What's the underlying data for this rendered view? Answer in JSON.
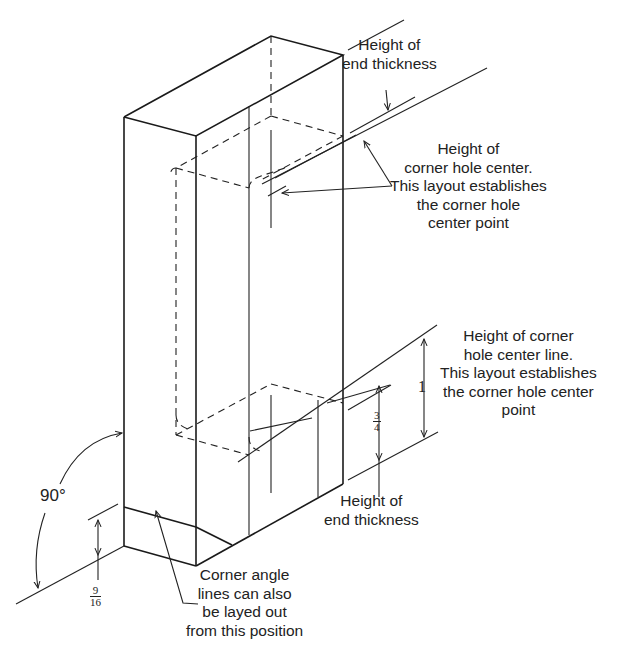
{
  "diagram": {
    "type": "isometric technical drawing",
    "labels": {
      "end_thickness_top": "Height of\nend thickness",
      "corner_hole_center": "Height of\ncorner hole center.\nThis layout establishes\nthe corner hole\ncenter point",
      "corner_hole_center_line": "Height of corner\nhole center line.\nThis layout establishes\nthe corner hole center\npoint",
      "end_thickness_bottom": "Height of\nend thickness",
      "corner_angle_lines": "Corner angle\nlines can also\nbe layed out\nfrom this position"
    },
    "dimensions": {
      "angle": "90°",
      "bottom_height_num": "9",
      "bottom_height_den": "16",
      "three_quarter_num": "3",
      "three_quarter_den": "4",
      "one": "1"
    },
    "line_color": "#1a1a1a",
    "background": "#ffffff"
  }
}
